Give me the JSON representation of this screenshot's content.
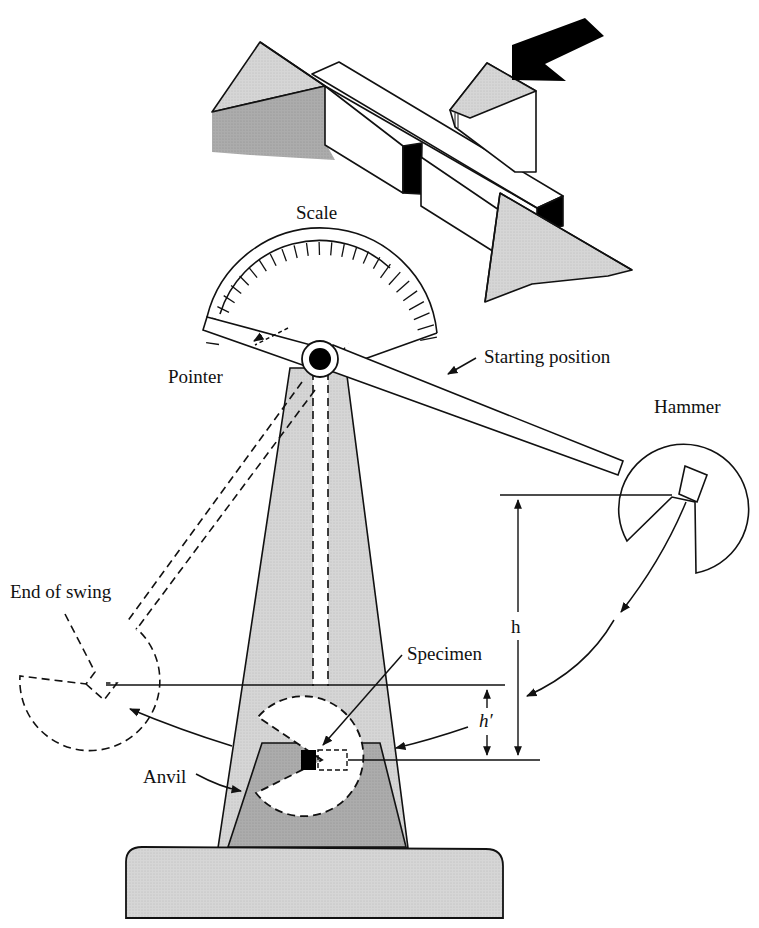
{
  "diagram": {
    "type": "charpy-impact-test-apparatus",
    "labels": {
      "scale": "Scale",
      "pointer": "Pointer",
      "starting_position": "Starting position",
      "hammer": "Hammer",
      "end_of_swing": "End of swing",
      "specimen": "Specimen",
      "anvil": "Anvil",
      "h": "h",
      "h_prime": "h′"
    },
    "colors": {
      "stroke": "#111111",
      "light_fill": "#d4d4d4",
      "mid_fill": "#bdbdbd",
      "dark_fill": "#a6a6a6",
      "specimen_fill": "#000000",
      "background": "#ffffff"
    },
    "parts": [
      "notched-specimen-detail",
      "impact-arrow",
      "scale-dial",
      "pointer",
      "pivot",
      "pendulum-arm",
      "hammer-head",
      "tower",
      "anvil",
      "base",
      "height-h",
      "height-h-prime"
    ]
  }
}
